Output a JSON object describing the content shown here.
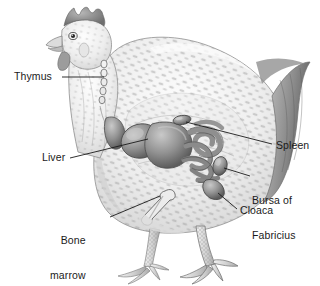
{
  "figure": {
    "style": "grayscale pencil/airbrush anatomical illustration",
    "background_color": "#ffffff",
    "ink_color": "#1a1a1a",
    "organ_fill_color": "#8d8d8d",
    "organ_shade_color": "#5e5e5e",
    "body_fill_color": "#e9e9e9",
    "feather_speckle_color": "#9a9a9a",
    "tail_color": "#707070"
  },
  "labels": [
    {
      "id": "thymus",
      "text": "Thymus",
      "side": "left",
      "x": 14,
      "y": 71,
      "leader": {
        "x1": 62,
        "y1": 77,
        "x2": 104,
        "y2": 77
      }
    },
    {
      "id": "liver",
      "text": "Liver",
      "side": "left",
      "x": 42,
      "y": 152,
      "leader": {
        "x1": 70,
        "y1": 158,
        "x2": 148,
        "y2": 139
      }
    },
    {
      "id": "bone-marrow",
      "text": "Bone\nmarrow",
      "line1": "Bone",
      "line2": "marrow",
      "side": "left",
      "x": 50,
      "y": 212,
      "leader": {
        "x1": 110,
        "y1": 217,
        "x2": 160,
        "y2": 196
      }
    },
    {
      "id": "spleen",
      "text": "Spleen",
      "side": "right",
      "x": 276,
      "y": 140,
      "leader": {
        "x1": 272,
        "y1": 144,
        "x2": 186,
        "y2": 122
      }
    },
    {
      "id": "bursa-of-fabricius",
      "text": "Bursa of\nFabricius",
      "line1": "Bursa of",
      "line2": "Fabricius",
      "side": "right",
      "x": 252,
      "y": 172,
      "leader": {
        "x1": 250,
        "y1": 176,
        "x2": 224,
        "y2": 168
      }
    },
    {
      "id": "cloaca",
      "text": "Cloaca",
      "side": "right",
      "x": 240,
      "y": 205,
      "leader": {
        "x1": 237,
        "y1": 209,
        "x2": 218,
        "y2": 193
      }
    }
  ],
  "organs": [
    {
      "id": "thymus",
      "name": "thymus",
      "description": "chain of small lobes along the neck"
    },
    {
      "id": "liver",
      "name": "liver",
      "description": "large two-lobed organ in the body cavity"
    },
    {
      "id": "spleen",
      "name": "spleen",
      "description": "small oval organ above the intestines"
    },
    {
      "id": "bursa",
      "name": "bursa of Fabricius",
      "description": "sac dorsal to the cloaca"
    },
    {
      "id": "cloaca",
      "name": "cloaca",
      "description": "terminal vent chamber"
    },
    {
      "id": "marrow",
      "name": "bone marrow",
      "description": "femur shown inside the thigh"
    },
    {
      "id": "intestine",
      "name": "intestines",
      "description": "coiled gut loops"
    }
  ]
}
